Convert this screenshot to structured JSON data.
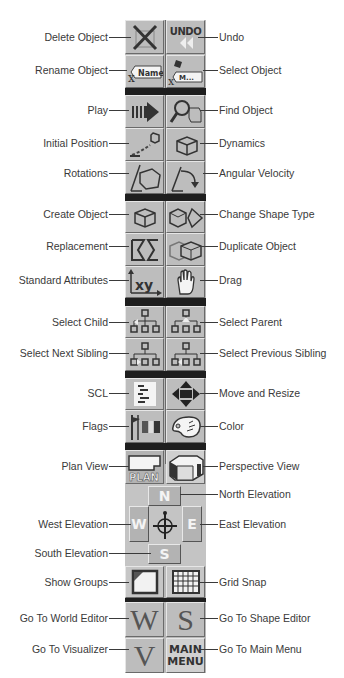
{
  "toolbar": {
    "rows": [
      {
        "left": {
          "label": "Delete Object",
          "icon": "delete-icon"
        },
        "right": {
          "label": "Undo",
          "icon": "undo-icon",
          "text": "UNDO"
        }
      },
      {
        "left": {
          "label": "Rename Object",
          "icon": "rename-icon",
          "text": "Name"
        },
        "right": {
          "label": "Select Object",
          "icon": "select-object-icon",
          "text": "M..."
        }
      },
      {
        "left": {
          "label": "Play",
          "icon": "play-icon"
        },
        "right": {
          "label": "Find Object",
          "icon": "find-object-icon"
        }
      },
      {
        "left": {
          "label": "Initial Position",
          "icon": "initial-position-icon"
        },
        "right": {
          "label": "Dynamics",
          "icon": "dynamics-icon"
        }
      },
      {
        "left": {
          "label": "Rotations",
          "icon": "rotations-icon"
        },
        "right": {
          "label": "Angular Velocity",
          "icon": "angular-velocity-icon"
        }
      },
      {
        "left": {
          "label": "Create Object",
          "icon": "create-object-icon"
        },
        "right": {
          "label": "Change Shape Type",
          "icon": "change-shape-type-icon"
        }
      },
      {
        "left": {
          "label": "Replacement",
          "icon": "replacement-icon"
        },
        "right": {
          "label": "Duplicate Object",
          "icon": "duplicate-object-icon"
        }
      },
      {
        "left": {
          "label": "Standard Attributes",
          "icon": "standard-attributes-icon",
          "text": "xy"
        },
        "right": {
          "label": "Drag",
          "icon": "drag-hand-icon"
        }
      },
      {
        "left": {
          "label": "Select Child",
          "icon": "select-child-icon"
        },
        "right": {
          "label": "Select Parent",
          "icon": "select-parent-icon"
        }
      },
      {
        "left": {
          "label": "Select Next Sibling",
          "icon": "select-next-sibling-icon"
        },
        "right": {
          "label": "Select Previous Sibling",
          "icon": "select-previous-sibling-icon"
        }
      },
      {
        "left": {
          "label": "SCL",
          "icon": "scl-script-icon"
        },
        "right": {
          "label": "Move and Resize",
          "icon": "move-resize-icon"
        }
      },
      {
        "left": {
          "label": "Flags",
          "icon": "flags-icon"
        },
        "right": {
          "label": "Color",
          "icon": "color-palette-icon"
        }
      },
      {
        "left": {
          "label": "Plan View",
          "icon": "plan-view-icon",
          "text": "PLAN"
        },
        "right": {
          "label": "Perspective View",
          "icon": "perspective-view-icon"
        }
      }
    ],
    "compass": {
      "north": {
        "label": "North Elevation",
        "text": "N"
      },
      "west": {
        "label": "West Elevation",
        "text": "W"
      },
      "east": {
        "label": "East Elevation",
        "text": "E"
      },
      "south": {
        "label": "South Elevation",
        "text": "S"
      }
    },
    "bottom_rows": [
      {
        "left": {
          "label": "Show Groups",
          "icon": "show-groups-icon"
        },
        "right": {
          "label": "Grid Snap",
          "icon": "grid-snap-icon"
        }
      },
      {
        "left": {
          "label": "Go To World Editor",
          "icon": "world-editor-icon",
          "text": "W"
        },
        "right": {
          "label": "Go To Shape Editor",
          "icon": "shape-editor-icon",
          "text": "S"
        }
      },
      {
        "left": {
          "label": "Go To Visualizer",
          "icon": "visualizer-icon",
          "text": "V"
        },
        "right": {
          "label": "Go To Main Menu",
          "icon": "main-menu-icon",
          "text_line1": "MAIN",
          "text_line2": "MENU"
        }
      }
    ]
  }
}
